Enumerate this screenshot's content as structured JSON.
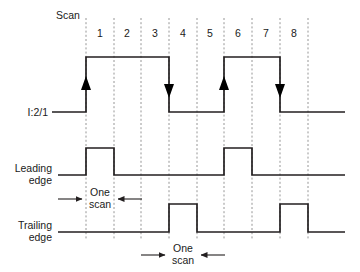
{
  "diagram": {
    "title_label": "Scan",
    "scan_numbers": [
      "1",
      "2",
      "3",
      "4",
      "5",
      "6",
      "7",
      "8"
    ],
    "signals": [
      {
        "id": "input",
        "label_lines": [
          "I:2/1"
        ],
        "low_y": 112,
        "high_y": 57,
        "transitions": [
          {
            "scan": 1,
            "edge": "rise",
            "x": 86,
            "marker": "up-arrow"
          },
          {
            "scan": 4,
            "edge": "fall",
            "x": 169,
            "marker": "down-arrow"
          },
          {
            "scan": 6,
            "edge": "rise",
            "x": 224,
            "marker": "up-arrow"
          },
          {
            "scan": 8,
            "edge": "fall",
            "x": 280,
            "marker": "down-arrow"
          }
        ],
        "high_intervals": [
          [
            86,
            169
          ],
          [
            224,
            280
          ]
        ]
      },
      {
        "id": "leading-edge",
        "label_lines": [
          "Leading",
          "edge"
        ],
        "low_y": 175,
        "high_y": 148,
        "high_intervals": [
          [
            86,
            114
          ],
          [
            224,
            252
          ]
        ],
        "pulse_scans": [
          1,
          6
        ]
      },
      {
        "id": "trailing-edge",
        "label_lines": [
          "Trailing",
          "edge"
        ],
        "low_y": 232,
        "high_y": 204,
        "high_intervals": [
          [
            169,
            197
          ],
          [
            280,
            308
          ]
        ],
        "pulse_scans": [
          4,
          8
        ]
      }
    ],
    "annotations": [
      {
        "id": "one-scan-leading",
        "text_lines": [
          "One",
          "scan"
        ],
        "text_x": 100,
        "text_y": 196,
        "left_arrow_from": 58,
        "left_arrow_to": 86,
        "right_arrow_from": 142,
        "right_arrow_to": 114,
        "arrow_y": 199
      },
      {
        "id": "one-scan-trailing",
        "text_lines": [
          "One",
          "scan"
        ],
        "text_x": 183,
        "text_y": 252,
        "left_arrow_from": 141,
        "left_arrow_to": 169,
        "right_arrow_from": 225,
        "right_arrow_to": 197,
        "arrow_y": 255
      }
    ],
    "gridline_x": [
      86,
      114,
      141,
      169,
      197,
      224,
      252,
      280,
      308
    ],
    "gridline_top": 18,
    "gridline_bottom": 240,
    "colors": {
      "waveform": "#231f20",
      "gridline": "#8a8a8a",
      "text": "#1a1a1a",
      "background": "#ffffff"
    }
  }
}
